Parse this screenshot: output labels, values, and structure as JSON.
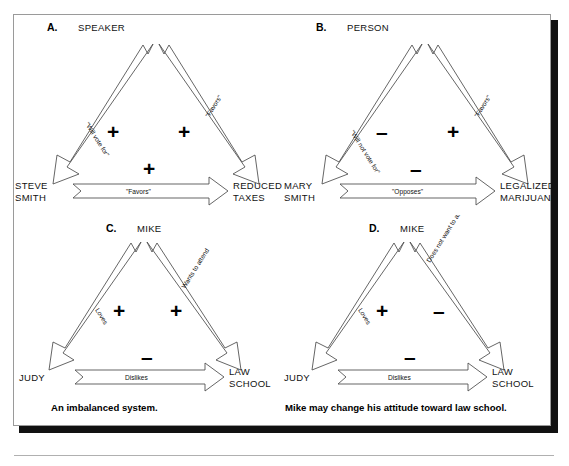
{
  "figure": {
    "panels": [
      {
        "id": "A",
        "letter": "A.",
        "top_node": "SPEAKER",
        "left_node_line1": "STEVE",
        "left_node_line2": "SMITH",
        "right_node_line1": "REDUCED",
        "right_node_line2": "TAXES",
        "left_edge_label": "\"Will vote for\"",
        "right_edge_label": "\"Favors\"",
        "bottom_edge_label": "\"Favors\"",
        "left_sign": "+",
        "right_sign": "+",
        "bottom_sign": "+",
        "caption": ""
      },
      {
        "id": "B",
        "letter": "B.",
        "top_node": "PERSON",
        "left_node_line1": "MARY",
        "left_node_line2": "SMITH",
        "right_node_line1": "LEGALIZED",
        "right_node_line2": "MARIJUANA",
        "left_edge_label": "\"Will not vote for\"",
        "right_edge_label": "\"Favors\"",
        "bottom_edge_label": "\"Opposes\"",
        "left_sign": "–",
        "right_sign": "+",
        "bottom_sign": "–",
        "caption": ""
      },
      {
        "id": "C",
        "letter": "C.",
        "top_node": "MIKE",
        "left_node_line1": "JUDY",
        "left_node_line2": "",
        "right_node_line1": "LAW",
        "right_node_line2": "SCHOOL",
        "left_edge_label": "Loves",
        "right_edge_label": "Wants to attend",
        "bottom_edge_label": "Dislikes",
        "left_sign": "+",
        "right_sign": "+",
        "bottom_sign": "–",
        "caption": "An imbalanced system."
      },
      {
        "id": "D",
        "letter": "D.",
        "top_node": "MIKE",
        "left_node_line1": "JUDY",
        "left_node_line2": "",
        "right_node_line1": "LAW",
        "right_node_line2": "SCHOOL",
        "left_edge_label": "Loves",
        "right_edge_label": "Does not want to attend",
        "bottom_edge_label": "Dislikes",
        "left_sign": "+",
        "right_sign": "–",
        "bottom_sign": "–",
        "caption": "Mike may change his attitude toward law school."
      }
    ],
    "colors": {
      "frame_border": "#9a9a9a",
      "shadow": "#111111",
      "arrow_stroke": "#4a4a4a",
      "arrow_fill": "#ffffff",
      "text": "#111111",
      "background": "#ffffff"
    }
  }
}
